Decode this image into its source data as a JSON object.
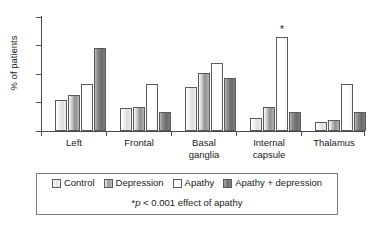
{
  "chart_data": {
    "type": "bar",
    "title": "",
    "xlabel": "",
    "ylabel": "% of patients",
    "ylim": [
      0,
      80
    ],
    "yticks": [
      0,
      20,
      40,
      60,
      80
    ],
    "grid": false,
    "legend_position": "bottom",
    "categories": [
      "Left",
      "Frontal",
      "Basal ganglia",
      "Internal capsule",
      "Thalamus"
    ],
    "series": [
      {
        "name": "Control",
        "values": [
          22,
          16,
          31,
          9,
          6
        ]
      },
      {
        "name": "Depression",
        "values": [
          25,
          17,
          41,
          17,
          8
        ]
      },
      {
        "name": "Apathy",
        "values": [
          33,
          33,
          48,
          66,
          33
        ]
      },
      {
        "name": "Apathy + depression",
        "values": [
          58,
          13,
          37,
          13,
          13
        ]
      }
    ],
    "annotations": [
      {
        "text": "*",
        "category": "Internal capsule",
        "series": "Apathy",
        "value": 66
      }
    ],
    "footnote": "*p < 0.001 effect of apathy"
  },
  "axis": {
    "y_title": "% of patients",
    "y_tick_labels": [
      "80",
      "60",
      "40",
      "20",
      "0"
    ],
    "x_tick_labels": [
      {
        "line1": "Left",
        "line2": ""
      },
      {
        "line1": "Frontal",
        "line2": ""
      },
      {
        "line1": "Basal",
        "line2": "ganglia"
      },
      {
        "line1": "Internal",
        "line2": "capsule"
      },
      {
        "line1": "Thalamus",
        "line2": ""
      }
    ]
  },
  "legend": {
    "entries": [
      {
        "label": "Control"
      },
      {
        "label": "Depression"
      },
      {
        "label": "Apathy"
      },
      {
        "label": "Apathy + depression"
      }
    ],
    "note_star": "*",
    "note_p": "p",
    "note_rest": " < 0.001 effect of apathy"
  },
  "marks": {
    "significance_star": "*"
  }
}
